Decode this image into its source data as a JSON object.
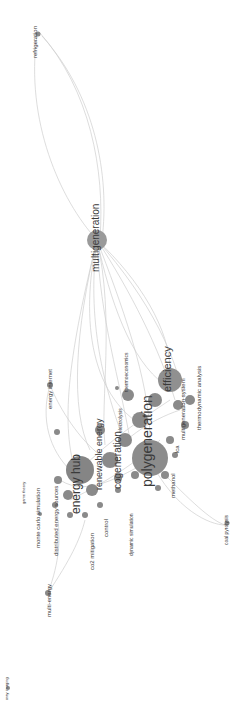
{
  "view": {
    "type": "keyword co-occurrence network",
    "orientation": "rotated 90deg counter-clockwise",
    "background": "#ffffff",
    "node_color": "#8a8a8a",
    "edge_color": "#cfcfcf",
    "label_color": "#3a3a3a"
  },
  "labels": {
    "refrigeration": "refrigeration",
    "multigeneration": "multigeneration",
    "efficiency": "efficiency",
    "polygeneration": "polygeneration",
    "thermoeconomics": "thermoeconomics",
    "electrolysis": "electrolysis",
    "multigeneration_system": "multigeneration system",
    "thermodynamic_analysis": "thermodynamic analysis",
    "methanol": "methanol",
    "lca": "lca",
    "coal_pyrolysis": "coal pyrolysis",
    "energy_internet": "energy internet",
    "renewable_energy": "renewable energy",
    "cogeneration": "cogeneration",
    "energy_hub": "energy hub",
    "game_theory": "game theory",
    "monte_carlo_simulation": "monte carlo simulation",
    "distributed_energy_sources": "distributed energy sources",
    "co2_mitigation": "co2 mitigation",
    "control": "control",
    "dynamic_simulation": "dynamic simulation",
    "multi_energy": "multi-energy",
    "xray_imaging": "xray imaging"
  }
}
